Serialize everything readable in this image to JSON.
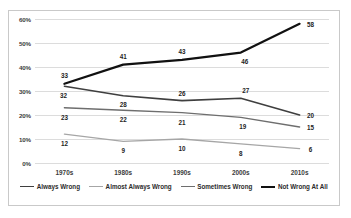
{
  "chart_data": {
    "type": "line",
    "title": "",
    "xlabel": "",
    "ylabel": "",
    "categories": [
      "1970s",
      "1980s",
      "1990s",
      "2000s",
      "2010s"
    ],
    "ylim": [
      0,
      60
    ],
    "ytick_labels": [
      "60%",
      "50%",
      "40%",
      "30%",
      "20%",
      "10%",
      "0%"
    ],
    "ytick_values": [
      60,
      50,
      40,
      30,
      20,
      10,
      0
    ],
    "grid": true,
    "legend_position": "bottom",
    "series": [
      {
        "name": "Always Wrong",
        "color": "#3f3f3f",
        "width": 1.6,
        "values": [
          32,
          28,
          26,
          27,
          20
        ],
        "labels": [
          "32",
          "28",
          "26",
          "27",
          "20"
        ]
      },
      {
        "name": "Almost Always Wrong",
        "color": "#a6a6a6",
        "width": 1.3,
        "values": [
          12,
          9,
          10,
          8,
          6
        ],
        "labels": [
          "12",
          "9",
          "10",
          "8",
          "6"
        ]
      },
      {
        "name": "Sometimes Wrong",
        "color": "#6e6e6e",
        "width": 1.4,
        "values": [
          23,
          22,
          21,
          19,
          15
        ],
        "labels": [
          "23",
          "22",
          "21",
          "19",
          "15"
        ]
      },
      {
        "name": "Not Wrong At All",
        "color": "#111111",
        "width": 2.2,
        "values": [
          33,
          41,
          43,
          46,
          58
        ],
        "labels": [
          "33",
          "41",
          "43",
          "46",
          "58"
        ]
      }
    ]
  }
}
